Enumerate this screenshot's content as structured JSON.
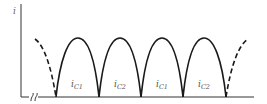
{
  "diagram": {
    "type": "waveform",
    "axis": {
      "y_label": "i",
      "break_symbol": "ff"
    },
    "lobes": [
      {
        "label_main": "i",
        "label_sub": "C1",
        "style": "solid"
      },
      {
        "label_main": "i",
        "label_sub": "C2",
        "style": "solid"
      },
      {
        "label_main": "i",
        "label_sub": "C1",
        "style": "solid"
      },
      {
        "label_main": "i",
        "label_sub": "C2",
        "style": "solid"
      }
    ],
    "edge_arcs": {
      "left": "dashed",
      "right": "dashed"
    },
    "colors": {
      "curve": "#1a1a1a",
      "axis": "#333333",
      "label": "#555555"
    }
  }
}
